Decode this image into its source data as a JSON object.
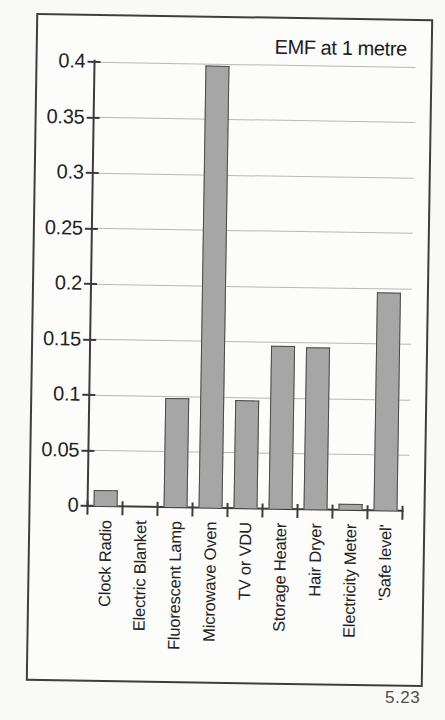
{
  "page": {
    "figure_number": "5.23"
  },
  "chart_data": {
    "type": "bar",
    "title": "EMF at 1 metre",
    "categories": [
      "Clock Radio",
      "Electric Blanket",
      "Fluorescent Lamp",
      "Microwave Oven",
      "TV or VDU",
      "Storage Heater",
      "Hair Dryer",
      "Electricity Meter",
      "'Safe level'"
    ],
    "values": [
      0.014,
      0,
      0.098,
      0.398,
      0.097,
      0.147,
      0.146,
      0.005,
      0.196
    ],
    "xlabel": "",
    "ylabel": "",
    "ylim": [
      0,
      0.4
    ],
    "ytick_labels": [
      "0",
      "0.05",
      "0.1",
      "0.15",
      "0.2",
      "0.25",
      "0.3",
      "0.35",
      "0.4"
    ],
    "grid": "horizontal",
    "legend": "none",
    "theme": {
      "bar_color": "#a6a6a6",
      "bar_border_color": "#4a4a4a",
      "axis_color": "#3c3c3c",
      "grid_color": "#b8b8b8",
      "frame_color": "#3e3e3e",
      "text_color": "#222222"
    }
  }
}
